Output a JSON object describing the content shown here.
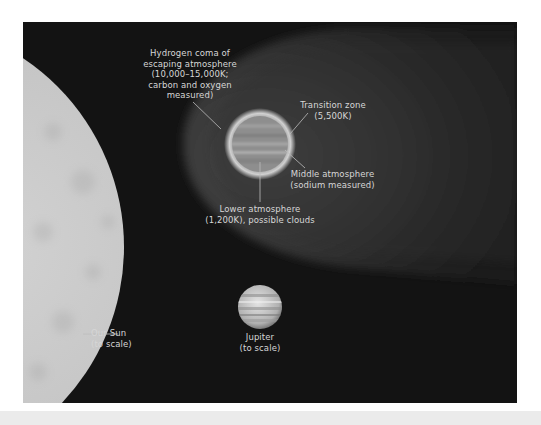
{
  "diagram": {
    "colors": {
      "background": "#131313",
      "page": "#ffffff",
      "bottom_band": "#ebebeb",
      "sun": "#c9c9c9",
      "coma": "#4a4a4a",
      "planet": "#9a9a9a",
      "label_text": "#d6d6d6",
      "leader_line": "#bdbdbd"
    },
    "labels": {
      "hydrogen_coma": "Hydrogen coma of\nescaping atmosphere\n(10,000–15,000K;\ncarbon and oxygen\nmeasured)",
      "transition_zone": "Transition zone\n(5,500K)",
      "middle_atmosphere": "Middle atmosphere\n(sodium measured)",
      "lower_atmosphere": "Lower atmosphere\n(1,200K), possible clouds",
      "jupiter": "Jupiter\n(to scale)",
      "sun": "Our Sun\n(to scale)"
    }
  }
}
